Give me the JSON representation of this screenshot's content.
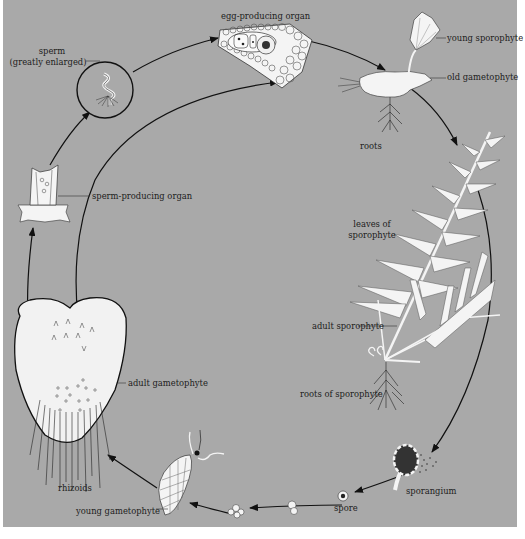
{
  "diagram": {
    "background_color": "#a9a9a9",
    "line_color": "#111111",
    "structure_fill": "#f4f4f4",
    "stages": [
      {
        "id": "sperm",
        "label_line1": "sperm",
        "label_line2": "(greatly enlarged)"
      },
      {
        "id": "egg-producing-organ",
        "label": "egg-producing organ"
      },
      {
        "id": "young-sporophyte",
        "label": "young sporophyte"
      },
      {
        "id": "old-gametophyte",
        "label": "old gametophyte"
      },
      {
        "id": "roots",
        "label": "roots"
      },
      {
        "id": "leaves-of-sporophyte",
        "label_line1": "leaves of",
        "label_line2": "sporophyte"
      },
      {
        "id": "adult-sporophyte",
        "label": "adult sporophyte"
      },
      {
        "id": "roots-of-sporophyte",
        "label": "roots of sporophyte"
      },
      {
        "id": "sporangium",
        "label": "sporangium"
      },
      {
        "id": "spore",
        "label": "spore"
      },
      {
        "id": "young-gametophyte",
        "label": "young gametophyte"
      },
      {
        "id": "rhizoids",
        "label": "rhizoids"
      },
      {
        "id": "adult-gametophyte",
        "label": "adult gametophyte"
      },
      {
        "id": "sperm-producing-organ",
        "label": "sperm-producing organ"
      }
    ]
  }
}
